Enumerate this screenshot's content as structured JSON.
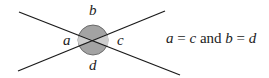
{
  "diagram": {
    "labels": {
      "a": "a",
      "b": "b",
      "c": "c",
      "d": "d"
    },
    "equation": {
      "var1": "a",
      "eq1": " = ",
      "var2": "c",
      "conj": " and ",
      "var3": "b",
      "eq2": " = ",
      "var4": "d"
    },
    "colors": {
      "line": "#1a1a1a",
      "angle_a_c_fill": "#c8c8c8",
      "angle_b_d_fill": "#a0a0a0",
      "circle_stroke": "#555555"
    }
  }
}
